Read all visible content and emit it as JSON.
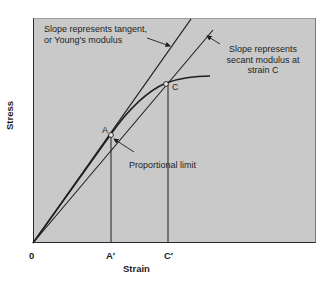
{
  "figure": {
    "title": "",
    "x_axis_label": "Strain",
    "y_axis_label": "Stress",
    "x_ticks": [
      "0",
      "A′",
      "C′"
    ],
    "points": {
      "A": "A",
      "C": "C"
    },
    "annotations": {
      "tangent": [
        "Slope represents tangent,",
        "or Young's modulus"
      ],
      "secant": [
        "Slope represents",
        "secant modulus at",
        "strain C"
      ],
      "proportional_limit": "Proportional limit"
    },
    "colors": {
      "panel": "#c9c9c9",
      "ink": "#1e1e1e",
      "background": "#ffffff"
    }
  }
}
